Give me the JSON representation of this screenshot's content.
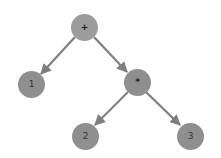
{
  "diagram": {
    "type": "expression-tree",
    "colors": {
      "node_fill": "#8f8f8f",
      "root_fill": "#9c9c9c",
      "edge": "#7f7f7f",
      "label": "#333333",
      "background": "#ffffff"
    },
    "nodes": [
      {
        "id": "plus",
        "label": "+",
        "cx": 84,
        "cy": 27
      },
      {
        "id": "one",
        "label": "1",
        "cx": 31,
        "cy": 84
      },
      {
        "id": "times",
        "label": "*",
        "cx": 137,
        "cy": 82
      },
      {
        "id": "two",
        "label": "2",
        "cx": 85,
        "cy": 136
      },
      {
        "id": "three",
        "label": "3",
        "cx": 190,
        "cy": 136
      }
    ],
    "edges": [
      {
        "from": "plus",
        "to": "one"
      },
      {
        "from": "plus",
        "to": "times"
      },
      {
        "from": "times",
        "to": "two"
      },
      {
        "from": "times",
        "to": "three"
      }
    ]
  }
}
